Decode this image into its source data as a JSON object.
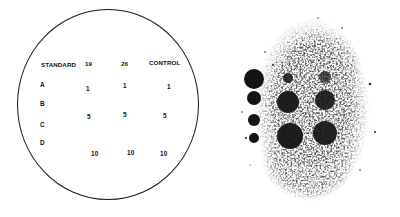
{
  "diagram": {
    "header": {
      "standard": "STANDARD",
      "col1": "19",
      "col2": "26",
      "control": "CONTROL"
    },
    "rows": [
      {
        "label": "A"
      },
      {
        "label": "B"
      },
      {
        "label": "C"
      },
      {
        "label": "D"
      }
    ],
    "values": {
      "row1": [
        "1",
        "1",
        "1"
      ],
      "row2": [
        "5",
        "5",
        "5"
      ],
      "row3": [
        "10",
        "10",
        "10"
      ]
    }
  },
  "blot": {
    "description": "Photograph of developed plate showing standard spots and sample spots",
    "standard_spots": [
      {
        "cx": 34,
        "cy": 79,
        "r": 10
      },
      {
        "cx": 34,
        "cy": 98,
        "r": 7
      },
      {
        "cx": 34,
        "cy": 120,
        "r": 6
      },
      {
        "cx": 34,
        "cy": 138,
        "r": 5
      }
    ],
    "sample_spots": [
      {
        "cx": 68,
        "cy": 78,
        "r": 5
      },
      {
        "cx": 105,
        "cy": 77,
        "r": 6
      },
      {
        "cx": 68,
        "cy": 102,
        "r": 11
      },
      {
        "cx": 105,
        "cy": 100,
        "r": 10
      },
      {
        "cx": 70,
        "cy": 136,
        "r": 13
      },
      {
        "cx": 105,
        "cy": 133,
        "r": 12
      }
    ],
    "ink_color": "#141414"
  }
}
